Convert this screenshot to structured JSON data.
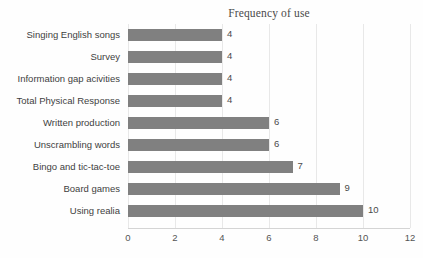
{
  "chart_data": {
    "type": "bar",
    "orientation": "horizontal",
    "title": "Frequency of use",
    "xlabel": "",
    "ylabel": "",
    "xlim": [
      0,
      12
    ],
    "xtick_step": 2,
    "xticks": [
      "0",
      "2",
      "4",
      "6",
      "8",
      "10",
      "12"
    ],
    "grid": true,
    "grid_axis": "x",
    "legend": false,
    "bar_color": "#808080",
    "data_labels": true,
    "categories": [
      "Singing English songs",
      "Survey",
      "Information gap acivities",
      "Total Physical Response",
      "Written production",
      "Unscrambling words",
      "Bingo and tic-tac-toe",
      "Board games",
      "Using realia"
    ],
    "values": [
      4,
      4,
      4,
      4,
      6,
      6,
      7,
      9,
      10
    ],
    "value_labels": [
      "4",
      "4",
      "4",
      "4",
      "6",
      "6",
      "7",
      "9",
      "10"
    ]
  },
  "colors": {
    "bar": "#808080",
    "gridline": "#e8e8e8",
    "axis": "#d4d4d4",
    "title_text": "#4a4a4a",
    "label_text": "#3f3f3f",
    "tick_text": "#555555",
    "background": "#fefefe"
  }
}
